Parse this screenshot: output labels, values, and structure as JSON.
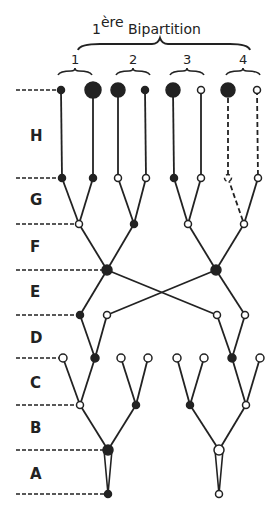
{
  "title": {
    "prefix": "1",
    "sup": "ère",
    "text": "Bipartition"
  },
  "groups": [
    {
      "label": "1",
      "x": 75
    },
    {
      "label": "2",
      "x": 133
    },
    {
      "label": "3",
      "x": 187
    },
    {
      "label": "4",
      "x": 243
    }
  ],
  "rows": [
    {
      "label": "H",
      "y": 136
    },
    {
      "label": "G",
      "y": 200
    },
    {
      "label": "F",
      "y": 247
    },
    {
      "label": "E",
      "y": 292
    },
    {
      "label": "D",
      "y": 338
    },
    {
      "label": "C",
      "y": 383
    },
    {
      "label": "B",
      "y": 428
    },
    {
      "label": "A",
      "y": 474
    }
  ],
  "levels": {
    "top": 90,
    "G": 178,
    "F": 224,
    "E": 270,
    "D": 315,
    "C": 358,
    "B": 405,
    "A": 450,
    "bottom": 494
  },
  "nodes": {
    "top": [
      {
        "x": 61,
        "r": 3.5,
        "fill": "dark"
      },
      {
        "x": 93,
        "r": 8,
        "fill": "dark"
      },
      {
        "x": 118,
        "r": 7,
        "fill": "dark"
      },
      {
        "x": 145,
        "r": 3.5,
        "fill": "dark"
      },
      {
        "x": 173,
        "r": 7,
        "fill": "dark"
      },
      {
        "x": 201,
        "r": 3.5,
        "fill": "open"
      },
      {
        "x": 228,
        "r": 7,
        "fill": "dark"
      },
      {
        "x": 257,
        "r": 3.5,
        "fill": "open"
      }
    ],
    "G": [
      {
        "x": 62,
        "fill": "dark"
      },
      {
        "x": 93,
        "fill": "dark"
      },
      {
        "x": 118,
        "fill": "open"
      },
      {
        "x": 146,
        "fill": "open"
      },
      {
        "x": 174,
        "fill": "dark"
      },
      {
        "x": 201,
        "fill": "open"
      },
      {
        "x": 228,
        "fill": "broken"
      },
      {
        "x": 258,
        "fill": "open"
      }
    ],
    "F": [
      {
        "x": 79,
        "fill": "open"
      },
      {
        "x": 134,
        "fill": "dark"
      },
      {
        "x": 188,
        "fill": "open"
      },
      {
        "x": 244,
        "fill": "open"
      }
    ],
    "E": [
      {
        "x": 107,
        "fill": "dark"
      },
      {
        "x": 216,
        "fill": "dark"
      }
    ],
    "D": [
      {
        "x": 80,
        "fill": "dark"
      },
      {
        "x": 107,
        "fill": "open"
      },
      {
        "x": 217,
        "fill": "open"
      },
      {
        "x": 245,
        "fill": "open"
      }
    ],
    "C": [
      {
        "x": 63,
        "fill": "open"
      },
      {
        "x": 95,
        "fill": "dark"
      },
      {
        "x": 121,
        "fill": "open"
      },
      {
        "x": 148,
        "fill": "open"
      },
      {
        "x": 177,
        "fill": "open"
      },
      {
        "x": 204,
        "fill": "open"
      },
      {
        "x": 232,
        "fill": "dark"
      },
      {
        "x": 260,
        "fill": "open"
      }
    ],
    "B": [
      {
        "x": 80,
        "fill": "open"
      },
      {
        "x": 136,
        "fill": "dark"
      },
      {
        "x": 190,
        "fill": "dark"
      },
      {
        "x": 246,
        "fill": "open"
      }
    ],
    "A": [
      {
        "x": 108,
        "fill": "dark"
      },
      {
        "x": 219,
        "fill": "open"
      }
    ],
    "bottom": [
      {
        "x": 108,
        "fill": "dark"
      },
      {
        "x": 219,
        "fill": "open"
      }
    ]
  },
  "colors": {
    "ink": "#222222",
    "paper": "#ffffff"
  }
}
